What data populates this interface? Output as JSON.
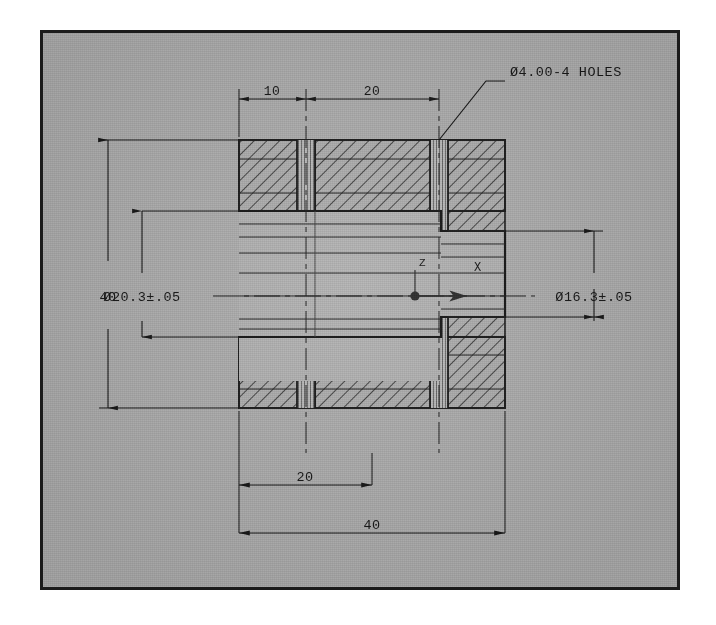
{
  "sheet": {
    "paper_color": "#ffffff",
    "plate_color": "#a9a9a9",
    "ink_color": "#151515",
    "border_color": "#1b1b1b"
  },
  "drawing": {
    "type": "mechanical-sectional-view",
    "title_note": "",
    "units_implied": "mm"
  },
  "annotations": {
    "leader_note": "Ø4.00-4 HOLES",
    "dim_top_left": "10",
    "dim_top_right": "20",
    "dim_left_overall": "40",
    "dim_left_bore": "Ø20.3±.05",
    "dim_right_bore": "Ø16.3±.05",
    "dim_bottom_inner": "20",
    "dim_bottom_overall": "40"
  },
  "ucs_icon": {
    "x_label": "X",
    "z_label": "Z"
  },
  "geometry": {
    "part_left": 196,
    "part_right": 462,
    "part_top": 107,
    "part_bottom": 375,
    "hole_center_left": 263,
    "hole_center_right": 396,
    "hole_half_width": 9,
    "axis_y": 263,
    "step_x": 398,
    "bore_left_top": 178,
    "bore_left_bottom": 348,
    "bore_right_top": 198,
    "bore_right_bottom": 328
  }
}
